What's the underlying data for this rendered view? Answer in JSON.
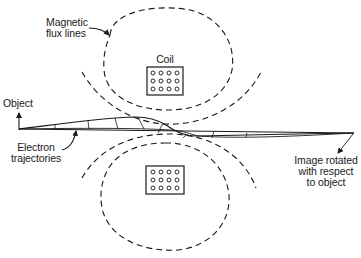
{
  "figure": {
    "type": "magnetic electron lens schematic",
    "labels": {
      "flux_lines": [
        "Magnetic",
        "flux lines"
      ],
      "coil": "Coil",
      "object": "Object",
      "electron_trajectories": [
        "Electron",
        "trajectories"
      ],
      "image": [
        "Image rotated",
        "with respect",
        "to object"
      ]
    },
    "coils": [
      {
        "position": "top",
        "rows": 3,
        "cols": 4,
        "winding": "circles"
      },
      {
        "position": "bottom",
        "rows": 3,
        "cols": 4,
        "winding": "circles"
      }
    ],
    "colors": {
      "ink": "#1a1a1a",
      "background": "#ffffff"
    }
  }
}
